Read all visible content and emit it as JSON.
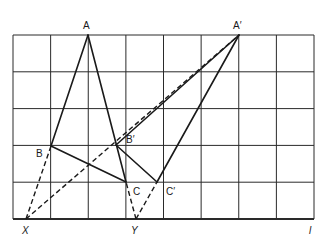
{
  "grid": {
    "x0": 13,
    "y0": 35,
    "x1": 314,
    "y1": 219,
    "cols": 8,
    "rows": 5,
    "color": "#2a2a2a"
  },
  "points": {
    "A": {
      "label": "A",
      "x": 88,
      "y": 35
    },
    "B": {
      "label": "B",
      "x": 51,
      "y": 146
    },
    "C": {
      "label": "C",
      "x": 126,
      "y": 182
    },
    "A2": {
      "label": "A′",
      "x": 239,
      "y": 35
    },
    "B2": {
      "label": "B′",
      "x": 116,
      "y": 145
    },
    "C2": {
      "label": "C′",
      "x": 157,
      "y": 182
    },
    "X": {
      "label": "X",
      "x": 26,
      "y": 219
    },
    "Y": {
      "label": "Y",
      "x": 136,
      "y": 219
    }
  },
  "labels": {
    "A": "A",
    "B": "B",
    "C": "C",
    "A2": "A′",
    "B2": "B′",
    "C2": "C′",
    "X": "X",
    "Y": "Y",
    "l": "l"
  },
  "solid_segments": [
    [
      "A",
      "B"
    ],
    [
      "A",
      "C"
    ],
    [
      "B",
      "C"
    ],
    [
      "A2",
      "B2"
    ],
    [
      "A2",
      "C2"
    ],
    [
      "B2",
      "C2"
    ]
  ],
  "dashed_segments": [
    [
      "X",
      "B"
    ],
    [
      "X",
      "A2"
    ],
    [
      "Y",
      "C"
    ],
    [
      "Y",
      "C2"
    ]
  ],
  "line_color": "#1a1a1a"
}
